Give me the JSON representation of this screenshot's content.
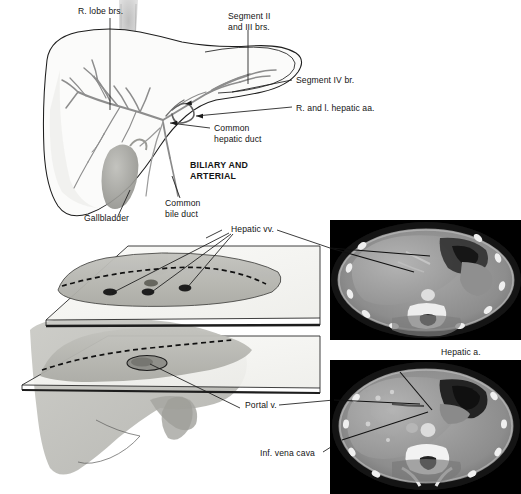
{
  "figure": {
    "title_block": "BILIARY AND ARTERIAL",
    "panels": {
      "top_diagram": "liver-biliary-arterial-diagram",
      "section_planes": "liver-section-planes-diagram",
      "ct_upper": "axial-ct-upper-slice",
      "ct_lower": "axial-ct-lower-slice"
    }
  },
  "labels": {
    "r_lobe_brs": "R. lobe brs.",
    "segment_ii_iii_line1": "Segment II",
    "segment_ii_iii_line2": "and III brs.",
    "segment_iv": "Segment IV br.",
    "hepatic_aa": "R. and l. hepatic aa.",
    "common_hepatic_duct_line1": "Common",
    "common_hepatic_duct_line2": "hepatic duct",
    "biliary_line1": "BILIARY AND",
    "biliary_line2": "ARTERIAL",
    "common_bile_duct_line1": "Common",
    "common_bile_duct_line2": "bile duct",
    "gallbladder": "Gallbladder",
    "hepatic_vv": "Hepatic vv.",
    "hepatic_a": "Hepatic a.",
    "portal_v": "Portal v.",
    "inf_vena_cava": "Inf. vena cava"
  },
  "colors": {
    "ink": "#141414",
    "leader": "#1a1a1a",
    "vessel": "#8a8a8a",
    "vessel_dark": "#6b6b6b",
    "liver_fill": "#f7f7f5",
    "section_fill": "#b9b9b4",
    "plane_fill": "#f4f4f1",
    "ct_background": "#000000",
    "ct_soft_tissue": "#9a9a9a",
    "ct_bone": "#f0f0f0"
  }
}
